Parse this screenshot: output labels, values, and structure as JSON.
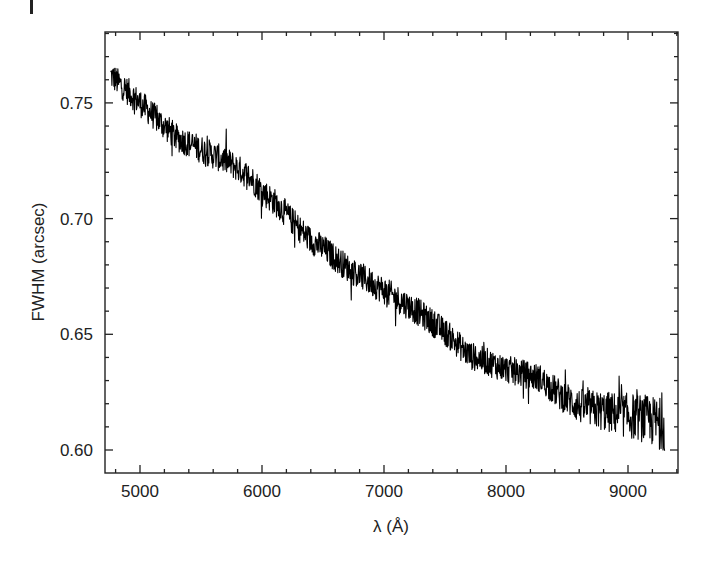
{
  "chart_data": {
    "type": "line",
    "title": "",
    "xlabel": "λ (Å)",
    "ylabel": "FWHM (arcsec)",
    "xlim": [
      4700,
      9450
    ],
    "ylim": [
      0.59,
      0.78
    ],
    "grid": false,
    "legend": null,
    "x_ticks": [
      5000,
      6000,
      7000,
      8000,
      9000
    ],
    "x_tick_labels": [
      "5000",
      "6000",
      "7000",
      "8000",
      "9000"
    ],
    "x_minor_step": 200,
    "y_ticks": [
      0.6,
      0.65,
      0.7,
      0.75
    ],
    "y_tick_labels": [
      "0.60",
      "0.65",
      "0.70",
      "0.75"
    ],
    "y_minor_step": 0.01,
    "series": [
      {
        "name": "FWHM",
        "color": "#000000",
        "style": "noisy-line",
        "noise_amplitude": 0.006,
        "x": [
          4760,
          4900,
          5000,
          5160,
          5300,
          5500,
          5740,
          5900,
          6000,
          6150,
          6230,
          6390,
          6480,
          6720,
          7000,
          7300,
          7500,
          7700,
          8000,
          8280,
          8440,
          8600,
          8770,
          9100,
          9300
        ],
        "y": [
          0.762,
          0.755,
          0.75,
          0.742,
          0.735,
          0.73,
          0.724,
          0.718,
          0.712,
          0.705,
          0.7,
          0.691,
          0.688,
          0.678,
          0.669,
          0.659,
          0.651,
          0.641,
          0.635,
          0.631,
          0.624,
          0.619,
          0.617,
          0.614,
          0.611
        ]
      }
    ]
  },
  "panel": {
    "marker": "|"
  }
}
